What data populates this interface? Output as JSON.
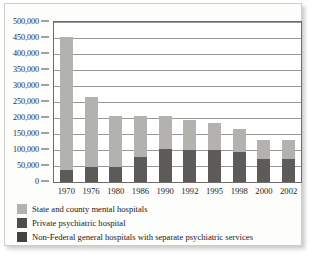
{
  "chart_data": {
    "type": "bar",
    "stacked": true,
    "title": "",
    "subtitle": "",
    "xlabel": "",
    "ylabel": "",
    "ylim": [
      0,
      500000
    ],
    "ytick_step": 50000,
    "ytick_labels": [
      "500,000",
      "450,000",
      "400,000",
      "350,000",
      "300,000",
      "250,000",
      "200,000",
      "150,000",
      "100,000",
      "50,000",
      "0"
    ],
    "ytick_values": [
      500000,
      450000,
      400000,
      350000,
      300000,
      250000,
      200000,
      150000,
      100000,
      50000,
      0
    ],
    "grid": true,
    "grid_axis": "y",
    "legend_position": "below",
    "categories": [
      "1970",
      "1976",
      "1980",
      "1986",
      "1990",
      "1992",
      "1995",
      "1998",
      "2000",
      "2002"
    ],
    "series": [
      {
        "name": "Non-Federal general hospitals with separate psychiatric services",
        "color": "#5d5b59",
        "stack_order": "bottom",
        "values": [
          37000,
          47000,
          48000,
          79000,
          102000,
          100000,
          99000,
          93000,
          72000,
          72000
        ]
      },
      {
        "name": "State and county mental hospitals",
        "color": "#b4b2ae",
        "stack_order": "top",
        "values": [
          415000,
          220000,
          157000,
          126000,
          103000,
          93000,
          84000,
          72000,
          60000,
          59000
        ]
      }
    ],
    "totals": [
      452000,
      267000,
      205000,
      205000,
      205000,
      193000,
      183000,
      165000,
      132000,
      131000
    ],
    "annotations": []
  },
  "legend": {
    "items": [
      {
        "label": "State and county mental hospitals",
        "color": "#b4b2ae",
        "swatch_name": "legend-swatch-state-county"
      },
      {
        "label": "Private psychiatric hospital",
        "color": "#4f4d4b",
        "swatch_name": "legend-swatch-private-psychiatric"
      },
      {
        "label": "Non-Federal general hospitals with separate psychiatric services",
        "color": "#444240",
        "swatch_name": "legend-swatch-non-federal"
      }
    ]
  }
}
